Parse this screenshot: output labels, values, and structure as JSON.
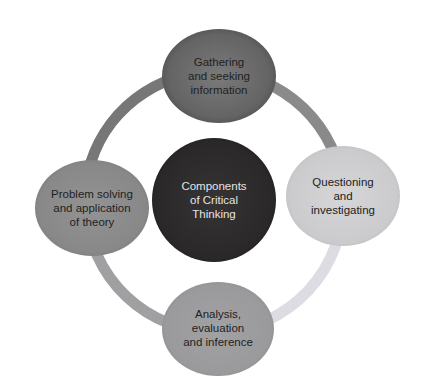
{
  "diagram": {
    "type": "cycle",
    "center": {
      "label": "Components\nof Critical\nThinking",
      "fill": "#2e2c2d",
      "text_color": "#e6e6e6"
    },
    "nodes": [
      {
        "id": "top",
        "label": "Gathering\nand seeking\ninformation",
        "fill": "#6b6b6b",
        "text_color": "#222222"
      },
      {
        "id": "right",
        "label": "Questioning\nand\ninvestigating",
        "fill": "#cfcfd2",
        "text_color": "#222222"
      },
      {
        "id": "bottom",
        "label": "Analysis,\nevaluation\nand inference",
        "fill": "#9c9c9e",
        "text_color": "#222222"
      },
      {
        "id": "left",
        "label": "Problem solving\nand application\nof theory",
        "fill": "#8c8c8c",
        "text_color": "#222222"
      }
    ],
    "ring_colors": {
      "top_left": "#777777",
      "top_right": "#8a8a8a",
      "bottom_right": "#dcdce2",
      "bottom_left": "#a0a0a2"
    }
  }
}
